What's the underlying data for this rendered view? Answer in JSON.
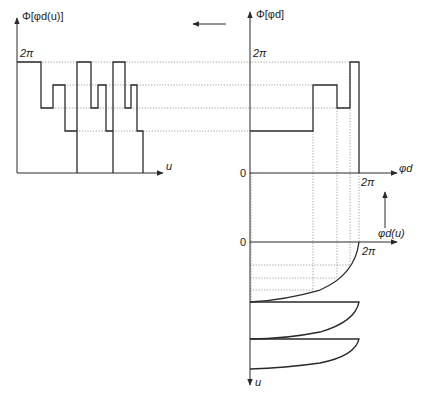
{
  "diagram": {
    "top_left_plot": {
      "y_axis_label": "Φ[φd(u)]",
      "x_axis_label": "u",
      "top_level_label": "2π",
      "levels_y": [
        62,
        85,
        108,
        131
      ],
      "baseline_y": 173,
      "waveform_points": "17,62 41,62 41,108 53,108 53,85 65,85 65,131 77,131 77,173 77,62 91,62 91,108 98,108 98,85 106,85 106,131 113,131 113,173 113,62 125,62 125,108 131,108 131,85 137,85 137,131 143,131 143,173"
    },
    "top_right_plot": {
      "y_axis_label": "Φ[φd]",
      "x_axis_label": "φd",
      "top_level_label": "2π",
      "origin_label": "0",
      "x_end_label": "2π",
      "step_points": "250,131 313,131 313,85 337,85 337,108 350,108 350,62 359,62 359,173"
    },
    "bottom_right_plot": {
      "x_axis_label": "φd(u)",
      "y_axis_label": "u",
      "origin_label": "0",
      "x_end_label": "2π"
    },
    "arrows": {
      "left_arrow": "mapping direction left",
      "up_arrow": "mapping direction up"
    }
  }
}
